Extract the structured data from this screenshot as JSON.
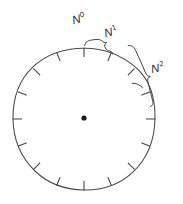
{
  "figure": {
    "background_color": "#ffffff",
    "line_color": "#4a4a4a",
    "label_color": "#2b2b2b",
    "width": 183,
    "height": 204
  },
  "circle": {
    "center_x": 84,
    "center_y": 119,
    "radius": 71,
    "tick_count": 16,
    "tick_spacing_degrees": 22.5,
    "tick_length": 8,
    "center_dot_radius": 2.6
  },
  "labels": {
    "n0": {
      "base": "N",
      "exponent": "0",
      "text": "N0"
    },
    "n1": {
      "base": "N",
      "exponent": "1",
      "text": "N1"
    },
    "n2": {
      "base": "N",
      "exponent": "2",
      "text": "N2"
    }
  },
  "braces": {
    "brace_n1": {
      "spans_intervals": 1,
      "position": "top"
    },
    "brace_n2": {
      "spans_intervals": 2,
      "position": "upper-right"
    }
  }
}
